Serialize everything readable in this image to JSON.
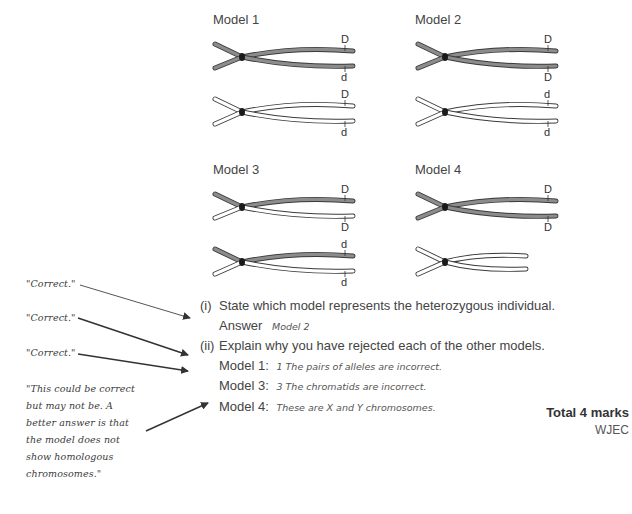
{
  "models": [
    {
      "title": "Model 1",
      "top_pair": {
        "fill": "grey",
        "upper_label": "D",
        "lower_label": "d"
      },
      "bottom_pair": {
        "fill": "white",
        "upper_label": "D",
        "lower_label": "d"
      }
    },
    {
      "title": "Model 2",
      "top_pair": {
        "fill": "grey",
        "upper_label": "D",
        "lower_label": "D"
      },
      "bottom_pair": {
        "fill": "white",
        "upper_label": "d",
        "lower_label": "d"
      }
    },
    {
      "title": "Model 3",
      "top_pair": {
        "fill": "mixed",
        "upper_label": "D",
        "lower_label": "D"
      },
      "bottom_pair": {
        "fill": "mixed",
        "upper_label": "d",
        "lower_label": "d"
      }
    },
    {
      "title": "Model 4",
      "top_pair": {
        "fill": "grey",
        "upper_label": "D",
        "lower_label": "D"
      },
      "bottom_pair": {
        "fill": "white-short",
        "upper_label": "",
        "lower_label": ""
      }
    }
  ],
  "question": {
    "part_i_num": "(i)",
    "part_i_text": "State which model represents the heterozygous individual.",
    "answer_label": "Answer",
    "answer_value": "Model 2",
    "part_ii_num": "(ii)",
    "part_ii_text": "Explain why you have rejected each of the other models.",
    "rejections": [
      {
        "label": "Model 1:",
        "answer": "1 The pairs of alleles are incorrect."
      },
      {
        "label": "Model 3:",
        "answer": "3 The chromatids are incorrect."
      },
      {
        "label": "Model 4:",
        "answer": "These are X and Y chromosomes."
      }
    ]
  },
  "comments": [
    {
      "text": "\"Correct.\""
    },
    {
      "text": "\"Correct.\""
    },
    {
      "text": "\"Correct.\""
    },
    {
      "lines": [
        "\"This could be correct",
        "but may not be. A",
        "better answer is that",
        "the model does not",
        "show homologous",
        "chromosomes.\""
      ]
    }
  ],
  "footer": {
    "total": "Total 4 marks",
    "board": "WJEC"
  },
  "colors": {
    "grey_chromatid": "#8c8c8c",
    "outline": "#3a3a3a",
    "centromere": "#1a1a1a"
  }
}
